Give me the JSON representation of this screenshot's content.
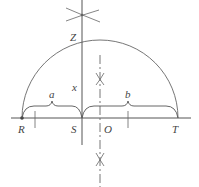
{
  "diagram": {
    "type": "geometric-construction",
    "points": {
      "R": {
        "label": "R"
      },
      "S": {
        "label": "S"
      },
      "O": {
        "label": "O"
      },
      "T": {
        "label": "T"
      },
      "Z": {
        "label": "Z"
      }
    },
    "segments": {
      "a": {
        "label": "a",
        "from": "R",
        "to": "S"
      },
      "b": {
        "label": "b",
        "from": "S",
        "to": "T"
      },
      "x": {
        "label": "x",
        "from": "S",
        "to": "Z"
      }
    },
    "colors": {
      "stroke": "#555555",
      "text": "#444444"
    }
  }
}
